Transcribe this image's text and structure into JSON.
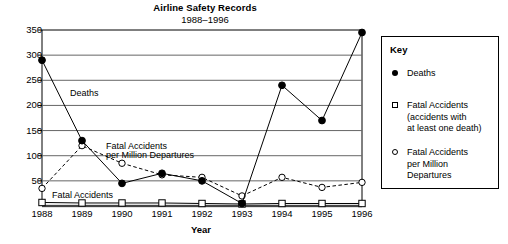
{
  "chart_data": {
    "type": "line",
    "title": "Airline Safety Records",
    "subtitle": "1988–1996",
    "xlabel": "Year",
    "ylabel": "",
    "categories": [
      "1988",
      "1989",
      "1990",
      "1991",
      "1992",
      "1993",
      "1994",
      "1995",
      "1996"
    ],
    "ylim": [
      0,
      350
    ],
    "yticks": [
      50,
      100,
      150,
      200,
      250,
      300,
      350
    ],
    "grid": true,
    "legend_position": "right",
    "series": [
      {
        "name": "Deaths",
        "marker": "filled-circle",
        "line": "solid",
        "values": [
          290,
          130,
          45,
          65,
          50,
          5,
          240,
          170,
          345
        ]
      },
      {
        "name": "Fatal Accidents",
        "marker": "open-square",
        "line": "solid",
        "values": [
          7,
          6,
          6,
          6,
          5,
          4,
          5,
          5,
          5
        ]
      },
      {
        "name": "Fatal Accidents per Million Departures",
        "marker": "open-circle",
        "line": "dashed",
        "values": [
          35,
          120,
          85,
          62,
          57,
          20,
          57,
          37,
          47
        ]
      }
    ],
    "annotations": [
      {
        "text": "Deaths",
        "x": 1988.6,
        "y": 222
      },
      {
        "text": "Fatal Accidents",
        "x": 1989.5,
        "y": 118
      },
      {
        "text": "per Million Departures",
        "x": 1989.5,
        "y": 100
      },
      {
        "text": "Fatal Accidents",
        "x": 1988.15,
        "y": 20
      }
    ]
  },
  "legend": {
    "title": "Key",
    "items": [
      {
        "marker": "filled-circle",
        "label": "Deaths"
      },
      {
        "marker": "open-square",
        "label": "Fatal Accidents\n(accidents with\nat least one death)"
      },
      {
        "marker": "open-circle",
        "label": "Fatal Accidents\nper Million\nDepartures"
      }
    ]
  },
  "colors": {
    "ink": "#000000",
    "grid": "#666666",
    "background": "#ffffff"
  }
}
